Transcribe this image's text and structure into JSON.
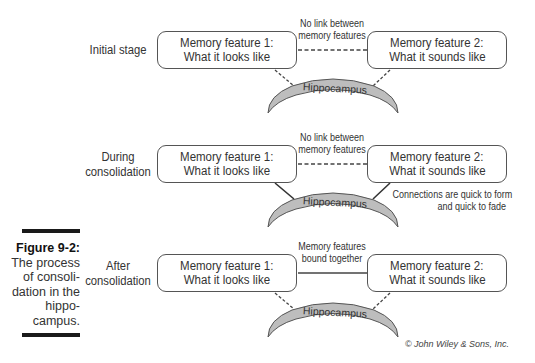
{
  "figure": {
    "number_label": "Figure 9-2:",
    "caption_lines": [
      "The process",
      "of consoli-",
      "dation in the",
      "hippo-",
      "campus."
    ],
    "copyright": "© John Wiley & Sons, Inc."
  },
  "feature1": {
    "line1": "Memory feature 1:",
    "line2": "What it looks like"
  },
  "feature2": {
    "line1": "Memory feature 2:",
    "line2": "What it sounds like"
  },
  "hippocampus_label": "Hippocampus",
  "stages": [
    {
      "label_lines": [
        "Initial stage"
      ],
      "link_note_lines": [
        "No link between",
        "memory features"
      ],
      "link_style": "dashed",
      "hippocampus_link_style": "dashed"
    },
    {
      "label_lines": [
        "During",
        "consolidation"
      ],
      "link_note_lines": [
        "No link between",
        "memory features"
      ],
      "link_style": "dashed",
      "hippocampus_link_style": "solid",
      "side_note_lines": [
        "Connections are quick to form",
        "and quick to fade"
      ]
    },
    {
      "label_lines": [
        "After",
        "consolidation"
      ],
      "link_note_lines": [
        "Memory features",
        "bound together"
      ],
      "link_style": "solid",
      "hippocampus_link_style": "dashed"
    }
  ],
  "colors": {
    "hippocampus_fill": "#bdbdbd",
    "stroke": "#444444",
    "figure_bar": "#1a1a1a"
  }
}
